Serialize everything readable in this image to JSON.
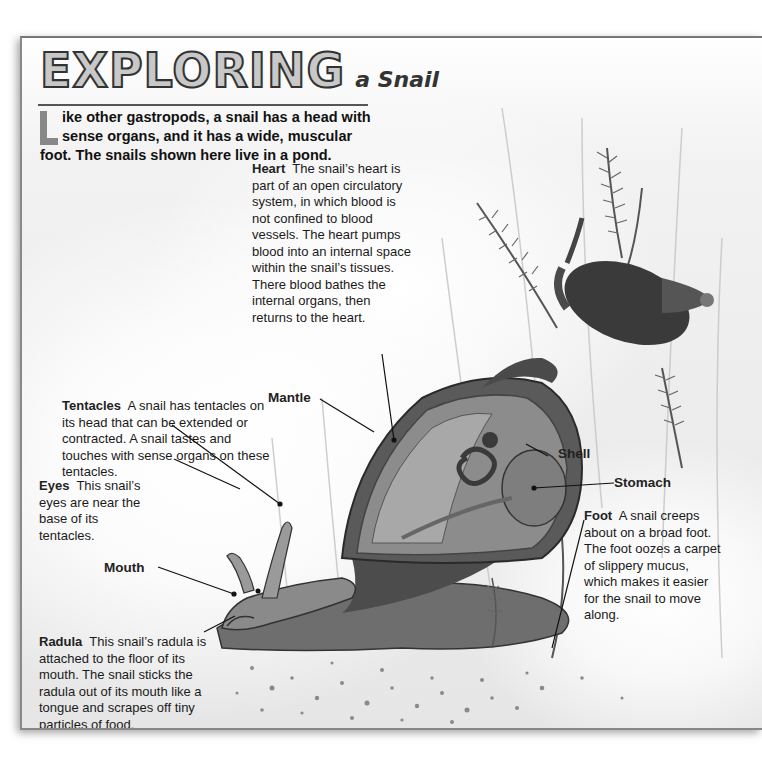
{
  "title": {
    "big": "EXPLORING",
    "small": "a Snail"
  },
  "intro": {
    "dropcap": "L",
    "text": "ike other gastropods, a snail has a head with sense organs, and it has a wide, muscular foot. The snails shown here live in a pond."
  },
  "callouts": {
    "heart": {
      "term": "Heart",
      "text": "The snail’s heart is part of an open circulatory system, in which blood is not confined to blood vessels. The heart pumps blood into an internal space within the snail’s tissues. There blood bathes the internal organs, then returns to the heart."
    },
    "tentacles": {
      "term": "Tentacles",
      "text": "A snail has tentacles on its head that can be extended or contracted. A snail tastes and touches with sense organs on these tentacles."
    },
    "eyes": {
      "term": "Eyes",
      "text": "This snail’s eyes are near the base of its tentacles."
    },
    "radula": {
      "term": "Radula",
      "text": "This snail’s radula is attached to the floor of its mouth. The snail sticks the radula out of its mouth like a tongue and scrapes off tiny particles of food."
    },
    "foot": {
      "term": "Foot",
      "text": "A snail creeps about on a broad foot. The foot oozes a carpet of slippery mucus, which makes it easier for the snail to move along."
    }
  },
  "labels": {
    "mantle": "Mantle",
    "shell": "Shell",
    "stomach": "Stomach",
    "mouth": "Mouth"
  },
  "colors": {
    "page_bg": "#ececec",
    "text": "#111111",
    "title_fill": "#c8c8c8",
    "title_stroke": "#333333",
    "dropcap": "#888888"
  }
}
